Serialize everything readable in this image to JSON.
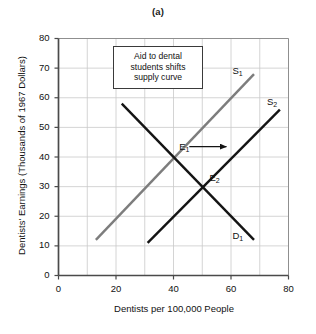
{
  "figure": {
    "panel_title": "(a)",
    "background_color": "#ffffff"
  },
  "chart_data": {
    "type": "line",
    "title": "(a)",
    "xlabel": "Dentists per 100,000 People",
    "ylabel": "Dentists' Earnings (Thousands of 1967 Dollars)",
    "xlim": [
      0,
      80
    ],
    "ylim": [
      0,
      80
    ],
    "grid": true,
    "xticks": [
      0,
      20,
      40,
      60,
      80
    ],
    "xtick_labels": [
      "0",
      "20",
      "40",
      "60",
      "80"
    ],
    "yticks": [
      0,
      10,
      20,
      30,
      40,
      50,
      60,
      70,
      80
    ],
    "ytick_labels": [
      "0",
      "10",
      "20",
      "30",
      "40",
      "50",
      "60",
      "70",
      "80"
    ],
    "x_minor_gridlines": [
      10,
      30,
      50,
      70
    ],
    "legend_position": "inline-curve-labels",
    "series": [
      {
        "name": "S1",
        "label": "S",
        "subscript": "1",
        "role": "original supply curve",
        "color": "#7d7d7d",
        "width": 2.4,
        "points": [
          [
            13,
            12
          ],
          [
            68,
            68
          ]
        ],
        "label_position": [
          60.5,
          69
        ]
      },
      {
        "name": "S2",
        "label": "S",
        "subscript": "2",
        "role": "shifted supply curve after aid",
        "color": "#141414",
        "width": 2.4,
        "points": [
          [
            31,
            11
          ],
          [
            77,
            56
          ]
        ],
        "label_position": [
          72.5,
          58.5
        ]
      },
      {
        "name": "D1",
        "label": "D",
        "subscript": "1",
        "role": "demand curve",
        "color": "#141414",
        "width": 2.4,
        "points": [
          [
            22,
            58
          ],
          [
            68,
            12
          ]
        ],
        "label_position": [
          60.5,
          13.5
        ]
      }
    ],
    "equilibria": [
      {
        "name": "E1",
        "label": "E",
        "subscript": "1",
        "x": 40,
        "y": 40,
        "label_position": [
          42,
          43.5
        ]
      },
      {
        "name": "E2",
        "label": "E",
        "subscript": "2",
        "x": 50,
        "y": 30,
        "label_position": [
          52.5,
          33
        ]
      }
    ],
    "annotations": [
      {
        "name": "shift-callout",
        "kind": "text-box",
        "lines": [
          "Aid to dental",
          "students shifts",
          "supply curve"
        ],
        "border_color": "#3a3a3a",
        "background_color": "#ffffff"
      },
      {
        "name": "shift-arrow",
        "kind": "arrow",
        "from": [
          45.5,
          43.5
        ],
        "to": [
          60.5,
          43.5
        ],
        "color": "#141414"
      }
    ]
  }
}
